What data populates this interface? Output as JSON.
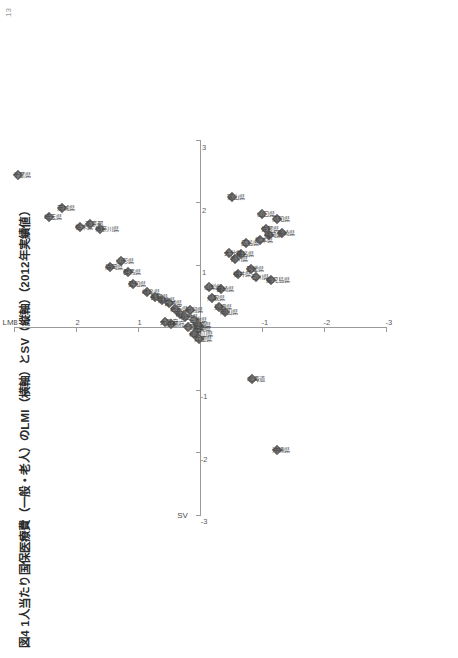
{
  "page": {
    "number": "13",
    "title": "図4  1人当たり国保医療費（一般・老人）のLMI（横軸）とSV（縦軸）（2012年実績値）"
  },
  "chart_data": {
    "type": "scatter",
    "title": "図4  1人当たり国保医療費（一般・老人）のLMI（横軸）とSV（縦軸）（2012年実績値）",
    "xlabel": "LMI",
    "ylabel": "SV",
    "xlim": [
      -3,
      3
    ],
    "ylim": [
      -3,
      3
    ],
    "xticks": [
      "-3",
      "-2",
      "-1",
      "1",
      "2",
      "3"
    ],
    "yticks": [
      "3",
      "2",
      "1",
      "-1",
      "-2",
      "-3"
    ],
    "grid": false,
    "legend": null,
    "orientation_note": "figure printed rotated 90° on the page",
    "points": [
      {
        "label": "千葉県",
        "x": 2.45,
        "y": 2.93
      },
      {
        "label": "埼玉県",
        "x": 1.77,
        "y": 2.43
      },
      {
        "label": "茨城県",
        "x": 1.92,
        "y": 2.22
      },
      {
        "label": "栃木県",
        "x": 1.62,
        "y": 1.94
      },
      {
        "label": "東京都",
        "x": 1.66,
        "y": 1.78
      },
      {
        "label": "神奈川県",
        "x": 1.58,
        "y": 1.62
      },
      {
        "label": "山形県",
        "x": 1.07,
        "y": 1.28
      },
      {
        "label": "静岡県",
        "x": 0.97,
        "y": 1.45
      },
      {
        "label": "群馬県",
        "x": 0.9,
        "y": 1.16
      },
      {
        "label": "愛知県",
        "x": 0.7,
        "y": 1.08
      },
      {
        "label": "岐阜県",
        "x": 0.57,
        "y": 0.86
      },
      {
        "label": "長野県",
        "x": 0.5,
        "y": 0.72
      },
      {
        "label": "福島県",
        "x": 0.45,
        "y": 0.62
      },
      {
        "label": "宮城県",
        "x": 0.4,
        "y": 0.5
      },
      {
        "label": "岩手県",
        "x": 0.3,
        "y": 0.4
      },
      {
        "label": "青森県",
        "x": 0.22,
        "y": 0.32
      },
      {
        "label": "秋田県",
        "x": 0.18,
        "y": 0.24
      },
      {
        "label": "新潟県",
        "x": 0.28,
        "y": 0.16
      },
      {
        "label": "三重県",
        "x": 0.12,
        "y": 0.1
      },
      {
        "label": "滋賀県",
        "x": 0.05,
        "y": 0.04
      },
      {
        "label": "奈良県",
        "x": -0.02,
        "y": 0.04
      },
      {
        "label": "和歌山県",
        "x": -0.1,
        "y": 0.1
      },
      {
        "label": "兵庫県",
        "x": -0.18,
        "y": 0.02
      },
      {
        "label": "京都府",
        "x": 0.06,
        "y": 0.46
      },
      {
        "label": "大阪府",
        "x": 0.1,
        "y": 0.56
      },
      {
        "label": "千葉以外",
        "x": 0.02,
        "y": 0.2
      },
      {
        "label": "鳥取県",
        "x": 0.48,
        "y": -0.2
      },
      {
        "label": "島根県",
        "x": 0.34,
        "y": -0.3
      },
      {
        "label": "岡山県",
        "x": 0.26,
        "y": -0.4
      },
      {
        "label": "山口県",
        "x": 1.82,
        "y": -1.0
      },
      {
        "label": "広島県",
        "x": 1.36,
        "y": -0.74
      },
      {
        "label": "香川県",
        "x": 1.1,
        "y": -0.56
      },
      {
        "label": "徳島県",
        "x": 1.18,
        "y": -0.66
      },
      {
        "label": "愛媛県",
        "x": 0.94,
        "y": -0.82
      },
      {
        "label": "高知県",
        "x": 1.74,
        "y": -1.24
      },
      {
        "label": "福岡県",
        "x": 1.48,
        "y": -1.12
      },
      {
        "label": "佐賀県",
        "x": 1.58,
        "y": -1.06
      },
      {
        "label": "長崎県",
        "x": 1.52,
        "y": -1.32
      },
      {
        "label": "熊本県",
        "x": 1.4,
        "y": -0.96
      },
      {
        "label": "大分県",
        "x": 1.2,
        "y": -0.46
      },
      {
        "label": "宮崎県",
        "x": 0.62,
        "y": -0.34
      },
      {
        "label": "鹿児島県",
        "x": 0.76,
        "y": -1.14
      },
      {
        "label": "石川県",
        "x": 0.82,
        "y": -0.9
      },
      {
        "label": "福井県",
        "x": 0.86,
        "y": -0.62
      },
      {
        "label": "富山県",
        "x": 2.1,
        "y": -0.52
      },
      {
        "label": "山梨県",
        "x": 0.66,
        "y": -0.14
      },
      {
        "label": "北海道",
        "x": -0.82,
        "y": -0.84
      },
      {
        "label": "沖縄県",
        "x": -1.96,
        "y": -1.24
      }
    ]
  }
}
